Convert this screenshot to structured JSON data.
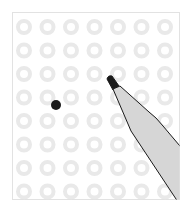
{
  "illustration": {
    "description": "Grid of light gray rings with a black dot and a marker pen",
    "grid": {
      "columns": 7,
      "rows": 8,
      "origin_x": 24,
      "origin_y": 27,
      "spacing_x": 23.5,
      "spacing_y": 23.5,
      "ring_radius": 6,
      "ring_width": 4,
      "ring_color": "#e9e9e9"
    },
    "dot": {
      "cx": 56,
      "cy": 105,
      "r": 5,
      "color": "#1a1a1a"
    },
    "pen": {
      "body_color": "#d6d6d6",
      "outline_color": "#1a1a1a",
      "tip_color": "#1a1a1a"
    },
    "frame_border_color": "#e2e2e2"
  }
}
